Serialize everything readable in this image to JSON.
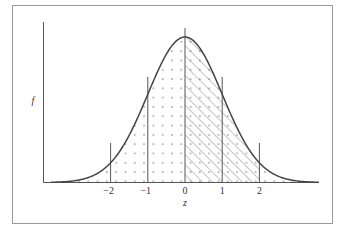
{
  "chart_data": {
    "type": "area",
    "title": "",
    "xlabel": "z",
    "ylabel": "f",
    "x_ticks": [
      "−2",
      "−1",
      "0",
      "1",
      "2"
    ],
    "x_tick_values": [
      -2,
      -1,
      0,
      1,
      2
    ],
    "xlim": [
      -3.6,
      3.6
    ],
    "curve": "standard normal density f(z)",
    "series": [
      {
        "name": "density",
        "x": [
          -3,
          -2,
          -1,
          0,
          1,
          2,
          3
        ],
        "values": [
          0.0044,
          0.054,
          0.242,
          0.399,
          0.242,
          0.054,
          0.0044
        ]
      }
    ],
    "regions": [
      {
        "name": "dotted",
        "from": -3.6,
        "to": 3.6,
        "fill": "dots"
      },
      {
        "name": "hatched",
        "from": 0,
        "to": 2,
        "fill": "diagonal-hatch"
      }
    ],
    "vertical_lines": [
      -2,
      -1,
      0,
      1,
      2
    ],
    "grid": false,
    "legend": null
  },
  "labels": {
    "y_axis": "f",
    "x_axis": "z",
    "ticks": [
      "−2",
      "−1",
      "0",
      "1",
      "2"
    ]
  },
  "colors": {
    "line": "#444444",
    "frame": "#999999",
    "background": "#ffffff"
  }
}
